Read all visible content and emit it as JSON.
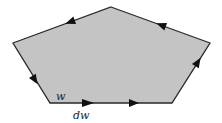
{
  "diagram": {
    "type": "oriented-contour-polygon",
    "fill_color": "#c4c4c4",
    "stroke_color": "#2a2a2a",
    "vertices": [
      [
        111,
        7
      ],
      [
        210,
        43
      ],
      [
        172,
        103
      ],
      [
        50,
        103
      ],
      [
        13,
        43
      ]
    ],
    "labels": {
      "w": "w",
      "dw": "dw"
    },
    "arrows": [
      {
        "edge": "top-left",
        "x": 70,
        "y": 22,
        "direction": "down-left"
      },
      {
        "edge": "top-right",
        "x": 161,
        "y": 26,
        "direction": "up-left"
      },
      {
        "edge": "right",
        "x": 198,
        "y": 62,
        "direction": "up"
      },
      {
        "edge": "bottom",
        "x": 88,
        "y": 103,
        "direction": "right"
      },
      {
        "edge": "bottom",
        "x": 134,
        "y": 103,
        "direction": "right"
      },
      {
        "edge": "left",
        "x": 35,
        "y": 80,
        "direction": "down"
      }
    ]
  }
}
